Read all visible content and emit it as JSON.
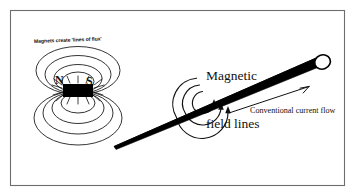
{
  "figure": {
    "background_color": "#ffffff",
    "ink_color": "#111111",
    "border_color": "#6e6e6e"
  },
  "labels": {
    "flux_caption": "Magnets create 'lines of flux'",
    "magnetic_field_lines_line1": "Magnetic",
    "magnetic_field_lines_line2": "field lines",
    "conventional_current": "Conventional current flow",
    "pole_north": "N",
    "pole_south": "S"
  },
  "left_panel": {
    "name": "bar-magnet-field",
    "magnet": {
      "fill": "#000000",
      "x": 63,
      "y": 84,
      "width": 30,
      "height": 13
    },
    "flux_loops_above": 4,
    "flux_loops_below": 4
  },
  "right_panel": {
    "name": "current-carrying-wire-field",
    "wire": {
      "fill": "#000000",
      "start_x": 114,
      "start_y": 146,
      "end_x": 324,
      "end_y": 62,
      "tip_shape": "circle-cap"
    },
    "field_arcs": 3,
    "arrow_heads": 3,
    "current_arrow_direction": "up-right"
  }
}
